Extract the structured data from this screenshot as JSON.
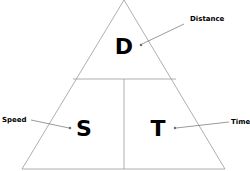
{
  "diagram": {
    "letters": {
      "top": "D",
      "bottom_left": "S",
      "bottom_right": "T"
    },
    "labels": {
      "distance": "Distance",
      "speed": "Speed",
      "time": "Time"
    },
    "colors": {
      "line": "#9a9a9a",
      "text": "#000000",
      "arrow": "#555555",
      "background": "#ffffff"
    }
  }
}
